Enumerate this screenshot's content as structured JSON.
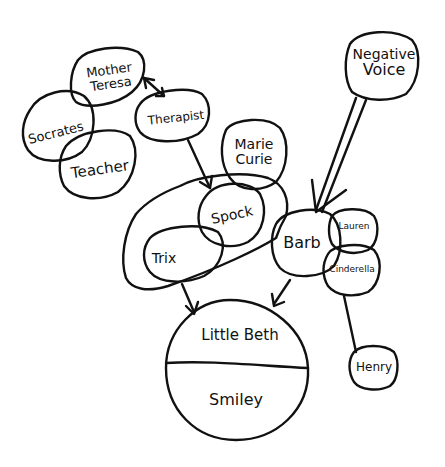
{
  "diagram": {
    "ink_color": "#111111",
    "background": "#ffffff",
    "nodes": {
      "mother_teresa": {
        "line1": "Mother",
        "line2": "Teresa"
      },
      "socrates": {
        "label": "Socrates"
      },
      "teacher": {
        "label": "Teacher"
      },
      "therapist": {
        "label": "Therapist"
      },
      "marie_curie": {
        "line1": "Marie",
        "line2": "Curie"
      },
      "spock": {
        "label": "Spock"
      },
      "trix": {
        "label": "Trix"
      },
      "barb": {
        "label": "Barb"
      },
      "lauren": {
        "label": "Lauren"
      },
      "cinderella": {
        "label": "Cinderella"
      },
      "negative_voice": {
        "line1": "Negative",
        "line2": "Voice"
      },
      "little_beth": {
        "label": "Little Beth"
      },
      "smiley": {
        "label": "Smiley"
      },
      "henry": {
        "label": "Henry"
      }
    },
    "edges": [
      {
        "from": "Mother Teresa",
        "to": "Therapist",
        "type": "bidirectional-arrow"
      },
      {
        "from": "Therapist",
        "to": "Spock",
        "type": "arrow"
      },
      {
        "from": "Trix",
        "to": "Little Beth",
        "type": "arrow"
      },
      {
        "from": "Barb",
        "to": "Little Beth",
        "type": "arrow"
      },
      {
        "from": "Negative Voice",
        "to": "Barb",
        "type": "wide-arrow"
      },
      {
        "from": "Cinderella",
        "to": "Henry",
        "type": "line"
      }
    ]
  }
}
